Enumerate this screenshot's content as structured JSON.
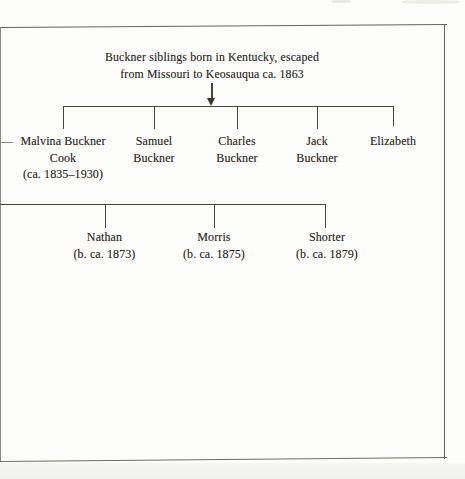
{
  "figure": {
    "caption": [
      "Buckner siblings born in Kentucky, escaped",
      "from Missouri to Keosauqua ca. 1863"
    ],
    "spouse_dash": "—",
    "generation1": [
      {
        "id": "malvina-buckner-cook",
        "lines": [
          "Malvina Buckner",
          "Cook",
          "(ca. 1835–1930)"
        ]
      },
      {
        "id": "samuel-buckner",
        "lines": [
          "Samuel",
          "Buckner"
        ]
      },
      {
        "id": "charles-buckner",
        "lines": [
          "Charles",
          "Buckner"
        ]
      },
      {
        "id": "jack-buckner",
        "lines": [
          "Jack",
          "Buckner"
        ]
      },
      {
        "id": "elizabeth",
        "lines": [
          "Elizabeth"
        ]
      }
    ],
    "generation2": [
      {
        "id": "nathan",
        "lines": [
          "Nathan",
          "(b. ca. 1873)"
        ]
      },
      {
        "id": "morris",
        "lines": [
          "Morris",
          "(b. ca. 1875)"
        ]
      },
      {
        "id": "shorter",
        "lines": [
          "Shorter",
          "(b. ca. 1879)"
        ]
      }
    ],
    "colors": {
      "text": "#2f2b26",
      "connector_line": "#47433d",
      "frame_border": "#64635f",
      "background": "#fcfcfa"
    }
  }
}
